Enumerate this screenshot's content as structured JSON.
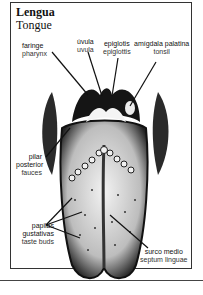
{
  "title": {
    "spanish": "Lengua",
    "english": "Tongue"
  },
  "labels": [
    {
      "id": "faringe",
      "spanish": "faringe",
      "english": "pharynx"
    },
    {
      "id": "uvula",
      "spanish": "úvula",
      "english": "uvula"
    },
    {
      "id": "epiglotis",
      "spanish": "epiglotis",
      "english": "epiglottis"
    },
    {
      "id": "amigdala",
      "spanish": "amígdala palatina",
      "english": "tonsil"
    },
    {
      "id": "pilar",
      "spanish": "pilar",
      "spanish2": "posterior",
      "english": "fauces"
    },
    {
      "id": "papilas",
      "spanish": "papilas",
      "spanish2": "gustativas",
      "english": "taste buds"
    },
    {
      "id": "surco",
      "spanish": "surco medio",
      "english": "septum linguae"
    }
  ],
  "colors": {
    "ink": "#111111",
    "frame": "#333333",
    "background": "#ffffff"
  }
}
